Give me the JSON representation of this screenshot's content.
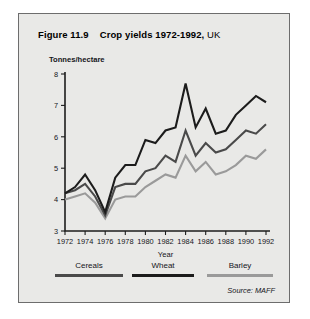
{
  "figure": {
    "label": "Figure 11.9",
    "title_bold": "Crop yields 1972-1992,",
    "title_regular": "UK",
    "source": "Source: MAFF"
  },
  "colors": {
    "card_background": "#e9e9e7",
    "card_border": "#6d6d6d",
    "axis": "#1d1d1d",
    "cereals": "#4a4a4a",
    "wheat": "#1c1c1c",
    "barley": "#9a9a9a"
  },
  "legend": {
    "position": "below-axis",
    "items": [
      {
        "label": "Cereals",
        "color": "#4a4a4a"
      },
      {
        "label": "Wheat",
        "color": "#1c1c1c"
      },
      {
        "label": "Barley",
        "color": "#9a9a9a"
      }
    ]
  },
  "chart_data": {
    "type": "line",
    "xlabel": "Year",
    "ylabel": "Tonnes/hectare",
    "ylim": [
      3,
      8
    ],
    "xlim": [
      1972,
      1992
    ],
    "yticks": [
      3,
      4,
      5,
      6,
      7,
      8
    ],
    "xticks": [
      1972,
      1974,
      1976,
      1978,
      1980,
      1982,
      1984,
      1986,
      1988,
      1990,
      1992
    ],
    "grid": false,
    "x": [
      1972,
      1973,
      1974,
      1975,
      1976,
      1977,
      1978,
      1979,
      1980,
      1981,
      1982,
      1983,
      1984,
      1985,
      1986,
      1987,
      1988,
      1989,
      1990,
      1991,
      1992
    ],
    "series": [
      {
        "name": "Cereals",
        "color": "#4a4a4a",
        "values": [
          4.2,
          4.3,
          4.5,
          4.1,
          3.5,
          4.4,
          4.5,
          4.5,
          4.9,
          5.0,
          5.4,
          5.2,
          6.2,
          5.4,
          5.8,
          5.5,
          5.6,
          5.9,
          6.2,
          6.1,
          6.4
        ]
      },
      {
        "name": "Wheat",
        "color": "#1c1c1c",
        "values": [
          4.2,
          4.4,
          4.8,
          4.3,
          3.6,
          4.7,
          5.1,
          5.1,
          5.9,
          5.8,
          6.2,
          6.3,
          7.7,
          6.3,
          6.9,
          6.1,
          6.2,
          6.7,
          7.0,
          7.3,
          7.1
        ]
      },
      {
        "name": "Barley",
        "color": "#9a9a9a",
        "values": [
          4.0,
          4.1,
          4.2,
          3.9,
          3.4,
          4.0,
          4.1,
          4.1,
          4.4,
          4.6,
          4.8,
          4.7,
          5.4,
          4.9,
          5.2,
          4.8,
          4.9,
          5.1,
          5.4,
          5.3,
          5.6
        ]
      }
    ]
  }
}
